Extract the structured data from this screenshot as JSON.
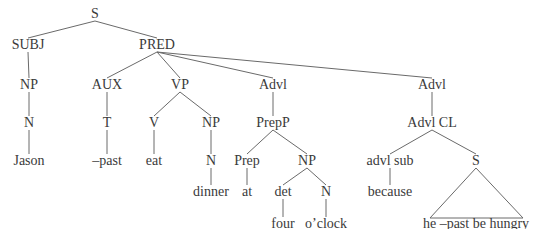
{
  "diagram": {
    "type": "syntax-tree",
    "line_color": "#6a6a6a",
    "text_color": "#3a3a3a",
    "nodes": [
      {
        "id": "S",
        "label": "S",
        "x": 95,
        "y": 19
      },
      {
        "id": "SUBJ",
        "label": "SUBJ",
        "x": 28,
        "y": 50
      },
      {
        "id": "PRED",
        "label": "PRED",
        "x": 157,
        "y": 50
      },
      {
        "id": "NP1",
        "label": "NP",
        "x": 29,
        "y": 90
      },
      {
        "id": "N1",
        "label": "N",
        "x": 29,
        "y": 128
      },
      {
        "id": "Jason",
        "label": "Jason",
        "x": 29,
        "y": 166
      },
      {
        "id": "AUX",
        "label": "AUX",
        "x": 107,
        "y": 90
      },
      {
        "id": "T",
        "label": "T",
        "x": 107,
        "y": 128
      },
      {
        "id": "past",
        "label": "–past",
        "x": 107,
        "y": 166
      },
      {
        "id": "VP",
        "label": "VP",
        "x": 180,
        "y": 90
      },
      {
        "id": "V",
        "label": "V",
        "x": 154,
        "y": 128
      },
      {
        "id": "eat",
        "label": "eat",
        "x": 154,
        "y": 166
      },
      {
        "id": "NP2",
        "label": "NP",
        "x": 211,
        "y": 128
      },
      {
        "id": "N2",
        "label": "N",
        "x": 211,
        "y": 166
      },
      {
        "id": "dinner",
        "label": "dinner",
        "x": 211,
        "y": 197
      },
      {
        "id": "Advl1",
        "label": "Advl",
        "x": 273,
        "y": 90
      },
      {
        "id": "PrepP",
        "label": "PrepP",
        "x": 273,
        "y": 128
      },
      {
        "id": "Prep",
        "label": "Prep",
        "x": 247,
        "y": 166
      },
      {
        "id": "at",
        "label": "at",
        "x": 247,
        "y": 197
      },
      {
        "id": "NP3",
        "label": "NP",
        "x": 307,
        "y": 166
      },
      {
        "id": "det",
        "label": "det",
        "x": 283,
        "y": 197
      },
      {
        "id": "four",
        "label": "four",
        "x": 283,
        "y": 229
      },
      {
        "id": "N3",
        "label": "N",
        "x": 326,
        "y": 197
      },
      {
        "id": "oclock",
        "label": "o’clock",
        "x": 326,
        "y": 229
      },
      {
        "id": "Advl2",
        "label": "Advl",
        "x": 432,
        "y": 90
      },
      {
        "id": "AdvlCL",
        "label": "Advl CL",
        "x": 432,
        "y": 128
      },
      {
        "id": "advlsub",
        "label": "advl sub",
        "x": 390,
        "y": 166
      },
      {
        "id": "because",
        "label": "because",
        "x": 390,
        "y": 197
      },
      {
        "id": "S2",
        "label": "S",
        "x": 476,
        "y": 166
      },
      {
        "id": "hungry",
        "label": "he –past be hungry",
        "x": 476,
        "y": 229
      }
    ],
    "edges": [
      [
        "S",
        "SUBJ"
      ],
      [
        "S",
        "PRED"
      ],
      [
        "SUBJ",
        "NP1"
      ],
      [
        "NP1",
        "N1"
      ],
      [
        "N1",
        "Jason"
      ],
      [
        "PRED",
        "AUX"
      ],
      [
        "PRED",
        "VP"
      ],
      [
        "PRED",
        "Advl1"
      ],
      [
        "PRED",
        "Advl2"
      ],
      [
        "AUX",
        "T"
      ],
      [
        "T",
        "past"
      ],
      [
        "VP",
        "V"
      ],
      [
        "VP",
        "NP2"
      ],
      [
        "V",
        "eat"
      ],
      [
        "NP2",
        "N2"
      ],
      [
        "N2",
        "dinner"
      ],
      [
        "Advl1",
        "PrepP"
      ],
      [
        "PrepP",
        "Prep"
      ],
      [
        "PrepP",
        "NP3"
      ],
      [
        "Prep",
        "at"
      ],
      [
        "NP3",
        "det"
      ],
      [
        "NP3",
        "N3"
      ],
      [
        "det",
        "four"
      ],
      [
        "N3",
        "oclock"
      ],
      [
        "Advl2",
        "AdvlCL"
      ],
      [
        "AdvlCL",
        "advlsub"
      ],
      [
        "AdvlCL",
        "S2"
      ],
      [
        "advlsub",
        "because"
      ]
    ],
    "triangles": [
      {
        "apex": "S2",
        "base_left_x": 430,
        "base_right_x": 523,
        "base_y": 218
      }
    ]
  }
}
